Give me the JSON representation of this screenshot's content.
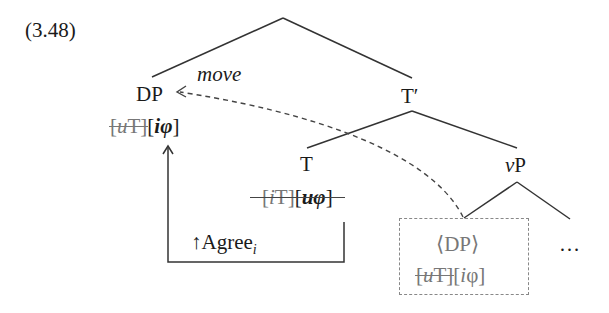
{
  "example": {
    "number": "(3.48)"
  },
  "tree": {
    "dp_moved": {
      "label": "DP",
      "features": [
        {
          "prefix": "u",
          "cat": "T",
          "checked": true
        },
        {
          "prefix": "i",
          "cat": "φ",
          "checked": false
        }
      ]
    },
    "t_bar": {
      "label": "T′"
    },
    "t_head": {
      "label": "T",
      "features": [
        {
          "prefix": "i",
          "cat": "T",
          "checked": true
        },
        {
          "prefix": "u",
          "cat": "φ",
          "checked": true
        }
      ]
    },
    "vp": {
      "label_v": "v",
      "label_p": "P"
    },
    "dp_trace": {
      "label": "⟨DP⟩",
      "features": [
        {
          "prefix": "u",
          "cat": "T",
          "checked": true
        },
        {
          "prefix": "i",
          "cat": "φ",
          "checked": false
        }
      ]
    },
    "ellipsis": "…"
  },
  "arrows": {
    "move_label": "move",
    "agree_arrow": "↑",
    "agree_label": "Agree",
    "agree_subscript": "i"
  },
  "colors": {
    "line": "#333333",
    "trace": "#777777",
    "dashed": "#444444"
  }
}
